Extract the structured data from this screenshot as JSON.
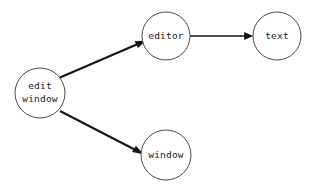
{
  "diagram": {
    "type": "directed-graph",
    "background_color": "#ffffff",
    "node_stroke_color": "#4a4a4a",
    "edge_color": "#141414",
    "label_color": "#1a1a1a",
    "nodes": [
      {
        "id": "edit-window",
        "label_lines": [
          "edit",
          "window"
        ],
        "label_line1": "edit",
        "label_line2": "window",
        "cx": 40,
        "cy": 93,
        "r": 25
      },
      {
        "id": "editor",
        "label_lines": [
          "editor"
        ],
        "label_line1": "editor",
        "cx": 166,
        "cy": 36,
        "r": 24
      },
      {
        "id": "text",
        "label_lines": [
          "text"
        ],
        "label_line1": "text",
        "cx": 277,
        "cy": 36,
        "r": 24
      },
      {
        "id": "window",
        "label_lines": [
          "window"
        ],
        "label_line1": "window",
        "cx": 166,
        "cy": 155,
        "r": 25
      }
    ],
    "edges": [
      {
        "id": "edit-window-to-editor",
        "from": "edit-window",
        "to": "editor",
        "label": ""
      },
      {
        "id": "editor-to-text",
        "from": "editor",
        "to": "text",
        "label": ""
      },
      {
        "id": "edit-window-to-window",
        "from": "edit-window",
        "to": "window",
        "label": ""
      }
    ]
  }
}
